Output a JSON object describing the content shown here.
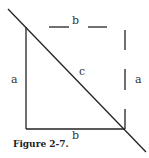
{
  "diagram": {
    "labels": {
      "top_b": "b",
      "left_a": "a",
      "hyp_c": "c",
      "right_a": "a",
      "bottom_b": "b"
    },
    "caption": "Figure 2-7.",
    "stroke_color": "#222222"
  }
}
